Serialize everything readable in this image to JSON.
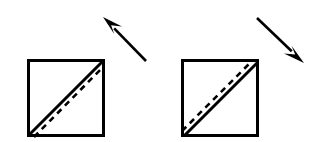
{
  "figure": {
    "background_color": "#ffffff",
    "ink_color": "#000000",
    "width": 313,
    "height": 142
  },
  "chart_data": {
    "type": "diagram",
    "title": "",
    "panels": [
      {
        "id": "left-panel",
        "label": "",
        "square": {
          "x": 27,
          "y": 59,
          "size": 78,
          "stroke_width": 3
        },
        "solid_diagonal": {
          "x1": 29,
          "y1": 135,
          "x2": 103,
          "y2": 61,
          "stroke_width": 3,
          "style": "solid"
        },
        "dashed_diagonal": {
          "x1": 34,
          "y1": 137,
          "x2": 104,
          "y2": 66,
          "stroke_width": 2.6,
          "style": "dashed",
          "dash_length": 6,
          "gap_length": 5,
          "offset_side": "below-right"
        },
        "arrow": {
          "tip_x": 103,
          "tip_y": 17,
          "tail_x": 146,
          "tail_y": 61,
          "direction": "up-left",
          "angle_deg": 225,
          "shaft_width": 2.6,
          "head_length": 20,
          "head_half_width": 7
        }
      },
      {
        "id": "right-panel",
        "label": "",
        "square": {
          "x": 181,
          "y": 59,
          "size": 78,
          "stroke_width": 3
        },
        "solid_diagonal": {
          "x1": 184,
          "y1": 136,
          "x2": 258,
          "y2": 62,
          "stroke_width": 3,
          "style": "solid"
        },
        "dashed_diagonal": {
          "x1": 182,
          "y1": 131,
          "x2": 253,
          "y2": 60,
          "stroke_width": 2.6,
          "style": "dashed",
          "dash_length": 6,
          "gap_length": 5,
          "offset_side": "above-left"
        },
        "arrow": {
          "tip_x": 304,
          "tip_y": 63,
          "tail_x": 257,
          "tail_y": 18,
          "direction": "down-right",
          "angle_deg": 45,
          "shaft_width": 2.6,
          "head_length": 21,
          "head_half_width": 7
        }
      }
    ],
    "legend": [],
    "annotations": []
  }
}
